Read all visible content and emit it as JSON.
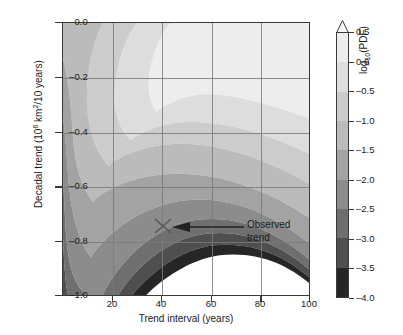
{
  "chart_data": {
    "type": "heatmap",
    "title": "",
    "xlabel": "Trend interval (years)",
    "ylabel": "Decadal trend (10⁶ km²/10 years)",
    "ylabel_parts": {
      "pre": "Decadal trend (10",
      "sup": "6",
      "mid": " km",
      "sup2": "2",
      "post": "/10 years)"
    },
    "xlim": [
      0,
      100
    ],
    "ylim": [
      -1.0,
      0.0
    ],
    "xticks": [
      20,
      40,
      60,
      80,
      100
    ],
    "xtick_labels": [
      "20",
      "40",
      "60",
      "80",
      "100"
    ],
    "yticks": [
      0.0,
      -0.2,
      -0.4,
      -0.6,
      -0.8,
      -1.0
    ],
    "ytick_labels": [
      "0.0",
      "–0.2",
      "–0.4",
      "–0.6",
      "–0.8",
      "–1.0"
    ],
    "grid": true,
    "grid_color": "#7a7a7a",
    "colorbar": {
      "label": "log",
      "label_sub": "10",
      "label_suffix": "(PDF)",
      "vmin": -4.0,
      "vmax": 0.5,
      "extend": "max",
      "ticks": [
        0.5,
        0.0,
        -0.5,
        -1.0,
        -1.5,
        -2.0,
        -2.5,
        -3.0,
        -3.5,
        -4.0
      ],
      "tick_labels": [
        "0.5",
        "0.0",
        "–0.5",
        "–1.0",
        "–1.5",
        "–2.0",
        "–2.5",
        "–3.0",
        "–3.5",
        "–4.0"
      ],
      "band_colors": [
        "#ededed",
        "#dddddd",
        "#cccccc",
        "#bbbbbb",
        "#a3a3a3",
        "#8c8c8c",
        "#6f6f6f",
        "#4f4f4f",
        "#262626"
      ],
      "band_values": [
        0.25,
        -0.25,
        -0.75,
        -1.25,
        -1.75,
        -2.25,
        -2.75,
        -3.25,
        -3.75
      ],
      "arrow_color": "#f7f7f7"
    },
    "contour_levels": [
      0.5,
      0.0,
      -0.5,
      -1.0,
      -1.5,
      -2.0,
      -2.5,
      -3.0,
      -3.5,
      -4.0
    ],
    "contour_fill_colors": [
      "#f7f7f7",
      "#ededed",
      "#dddddd",
      "#cccccc",
      "#bbbbbb",
      "#a3a3a3",
      "#8c8c8c",
      "#6f6f6f",
      "#4f4f4f",
      "#262626"
    ],
    "background_below_min": "#ffffff",
    "annotations": [
      {
        "name": "observed-trend",
        "text_line1": "Observed",
        "text_line2": "trend",
        "marker": "x",
        "marker_x_years": 42,
        "marker_y_trend": -0.78,
        "arrow": "left"
      }
    ]
  }
}
